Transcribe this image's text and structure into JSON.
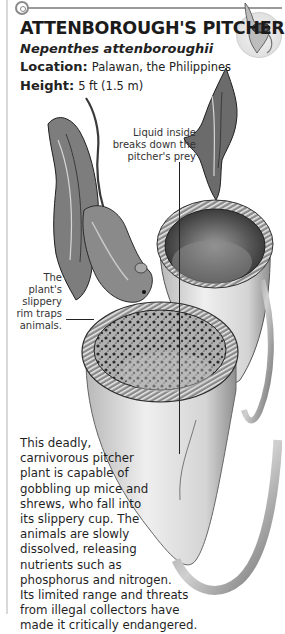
{
  "header": {
    "title": "ATTENBOROUGH'S PITCHER",
    "scientific_name": "Nepenthes attenboroughii",
    "facts": [
      {
        "label": "Location:",
        "value": "Palawan, the Philippines"
      },
      {
        "label": "Height:",
        "value": "5 ft (1.5 m)"
      }
    ],
    "icons": {
      "section_marker": "target-icon",
      "thumbnail": "pitcher-plant-thumbnail"
    }
  },
  "callouts": {
    "liquid": [
      "Liquid inside",
      "breaks down the",
      "pitcher's prey"
    ],
    "rim": [
      "The plant's",
      "slippery",
      "rim traps",
      "animals."
    ]
  },
  "description": {
    "lines": [
      "This deadly,",
      "carnivorous pitcher",
      "plant is capable of",
      "gobbling up mice and",
      "shrews, who fall into",
      "its slippery cup. The",
      "animals are slowly",
      "dissolved, releasing",
      "nutrients such as",
      "phosphorus and nitrogen.",
      "Its limited range and threats",
      "from illegal collectors have",
      "made it critically endangered."
    ]
  },
  "colors": {
    "rule": "#9a9a9a",
    "text": "#1b1b1b",
    "illustration_dark": "#2a2a2a",
    "illustration_mid": "#8c8c8c",
    "illustration_light": "#e6e6e6"
  }
}
